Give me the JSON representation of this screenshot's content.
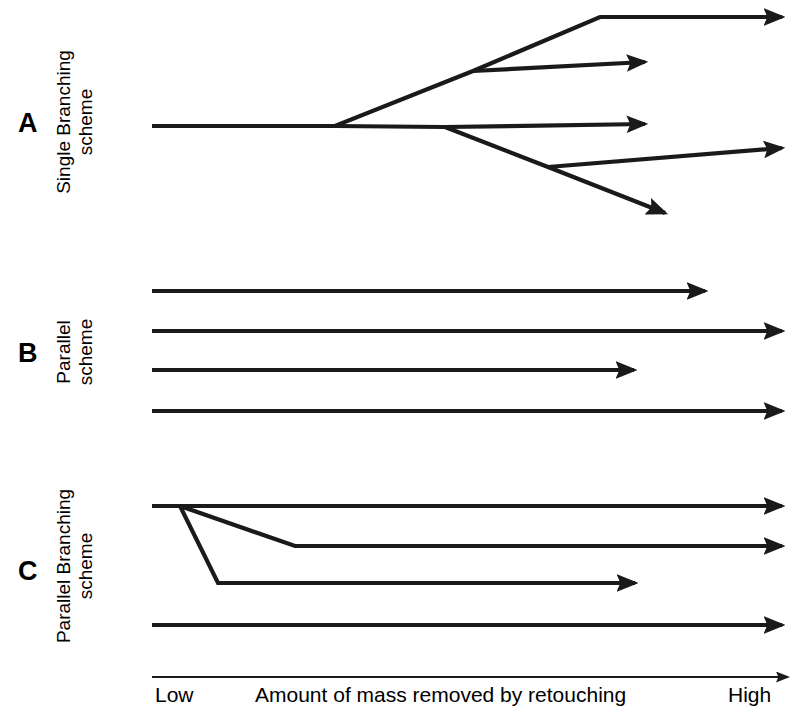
{
  "figure": {
    "width": 796,
    "height": 722,
    "background": "#ffffff",
    "stroke_color": "#1a1a1a",
    "stroke_width": 4.2,
    "axis_stroke_width": 2.0
  },
  "panels": [
    {
      "letter": "A",
      "caption_line1": "Single Branching",
      "caption_line2": "scheme",
      "caption": "Single Branching\nscheme",
      "letter_x": 18,
      "letter_y": 110,
      "caption_cx": 75,
      "caption_cy": 122
    },
    {
      "letter": "B",
      "caption_line1": "Parallel",
      "caption_line2": "scheme",
      "caption": "Parallel\nscheme",
      "letter_x": 18,
      "letter_y": 340,
      "caption_cx": 75,
      "caption_cy": 352
    },
    {
      "letter": "C",
      "caption_line1": "Parallel Branching",
      "caption_line2": "scheme",
      "caption": "Parallel Branching\nscheme",
      "letter_x": 18,
      "letter_y": 558,
      "caption_cx": 75,
      "caption_cy": 566
    }
  ],
  "axis": {
    "x_start": 152,
    "x_end": 788,
    "y": 677,
    "low_label": "Low",
    "title_label": "Amount of mass removed by retouching",
    "high_label": "High",
    "low_x": 155,
    "title_x": 255,
    "high_x": 728,
    "label_y": 683
  },
  "chart_data": {
    "type": "diagram",
    "title": "",
    "xlabel": "Amount of mass removed by retouching",
    "xlim_labels": [
      "Low",
      "High"
    ],
    "grid": false,
    "legend": null,
    "panels": [
      {
        "id": "A",
        "name": "Single Branching scheme",
        "description": "One trunk that successively bifurcates into five terminal arrows.",
        "polylines": [
          {
            "name": "trunk-to-upper-branch",
            "points": "152,126 335,126 473,71 600,17 782,17",
            "arrow": true
          },
          {
            "name": "upper-sub-branch",
            "points": "473,71 645,62",
            "arrow": true
          },
          {
            "name": "trunk-middle",
            "points": "335,126 445,127 645,124",
            "arrow": true
          },
          {
            "name": "lower-branch",
            "points": "445,127 548,167 665,213",
            "arrow": true
          },
          {
            "name": "lower-sub-branch",
            "points": "548,167 782,148",
            "arrow": true
          }
        ]
      },
      {
        "id": "B",
        "name": "Parallel scheme",
        "description": "Four independent parallel horizontal arrows of differing lengths.",
        "polylines": [
          {
            "name": "parallel-line-1",
            "points": "152,291 705,291",
            "arrow": true
          },
          {
            "name": "parallel-line-2",
            "points": "152,331 782,331",
            "arrow": true
          },
          {
            "name": "parallel-line-3",
            "points": "152,370 634,370",
            "arrow": true
          },
          {
            "name": "parallel-line-4",
            "points": "152,411 782,411",
            "arrow": true
          }
        ]
      },
      {
        "id": "C",
        "name": "Parallel Branching scheme",
        "description": "A top trunk that sheds two descending branches, plus one independent parallel arrow.",
        "polylines": [
          {
            "name": "top-trunk",
            "points": "152,506 782,506",
            "arrow": true
          },
          {
            "name": "shallow-branch",
            "points": "180,506 295,546 782,546",
            "arrow": true
          },
          {
            "name": "steep-branch",
            "points": "180,506 218,583 635,583",
            "arrow": true
          },
          {
            "name": "independent-line",
            "points": "152,625 782,625",
            "arrow": true
          }
        ]
      }
    ]
  }
}
